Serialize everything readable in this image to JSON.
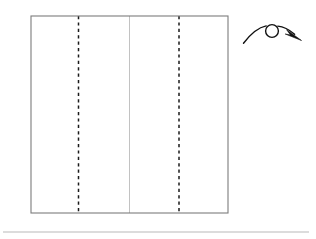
{
  "figure": {
    "caption": "",
    "background_color": "#ffffff",
    "canvas": {
      "width": 316,
      "height": 239
    },
    "paper": {
      "name": "square-sheet",
      "shape": "rectangle",
      "x": 31,
      "y": 16,
      "width": 197,
      "height": 197,
      "fill_color": "#ffffff",
      "outline_color": "#7c7c7c",
      "outline_width": 1.1
    },
    "center_crease": {
      "name": "existing-center-crease",
      "orientation": "vertical",
      "x": 129.5,
      "y_start": 16,
      "y_end": 213,
      "style": "solid",
      "color": "#c2c2c2",
      "meaning": "existing crease"
    },
    "fold_creases": [
      {
        "name": "left-fold-line",
        "orientation": "vertical",
        "x": 78.5,
        "y_start": 16,
        "y_end": 213,
        "style": "dashed",
        "color": "#1a1a1a",
        "dash": "3.2 3.2",
        "meaning": "valley fold"
      },
      {
        "name": "right-fold-line",
        "orientation": "vertical",
        "x": 179,
        "y_start": 16,
        "y_end": 213,
        "style": "dashed",
        "color": "#1a1a1a",
        "dash": "3.2 3.2",
        "meaning": "valley fold"
      }
    ],
    "turn_over_arrow": {
      "name": "turn-over-arrow",
      "meaning": "turn the model over",
      "color": "#111111",
      "curve_start": {
        "x": 243,
        "y": 43
      },
      "curve_end": {
        "x": 297,
        "y": 36
      },
      "apex": {
        "x": 272,
        "y": 24
      },
      "loop": {
        "cx": 272,
        "cy": 31,
        "r": 6.4
      },
      "arrowhead": {
        "x": 300,
        "y": 39,
        "direction": "down-right"
      }
    },
    "footer_rule": {
      "name": "footer-separator",
      "x_start": 3,
      "x_end": 309,
      "y": 232,
      "color": "#b9b9b9"
    }
  }
}
